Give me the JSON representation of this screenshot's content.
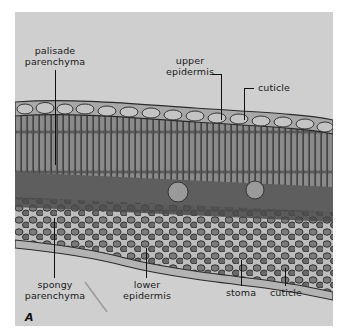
{
  "figure": {
    "panel_letter": "A",
    "background_color": "#cfcfcf",
    "tissue_dark": "#3a3a3a",
    "tissue_mid": "#6d6d6d",
    "tissue_light": "#a9a9a9"
  },
  "labels": {
    "palisade_parenchyma": {
      "line1": "palisade",
      "line2": "parenchyma"
    },
    "upper_epidermis": {
      "line1": "upper",
      "line2": "epidermis"
    },
    "cuticle_top": {
      "text": "cuticle"
    },
    "spongy_parenchyma": {
      "line1": "spongy",
      "line2": "parenchyma"
    },
    "lower_epidermis": {
      "line1": "lower",
      "line2": "epidermis"
    },
    "stoma": {
      "text": "stoma"
    },
    "cuticle_bottom": {
      "text": "cuticle"
    }
  }
}
